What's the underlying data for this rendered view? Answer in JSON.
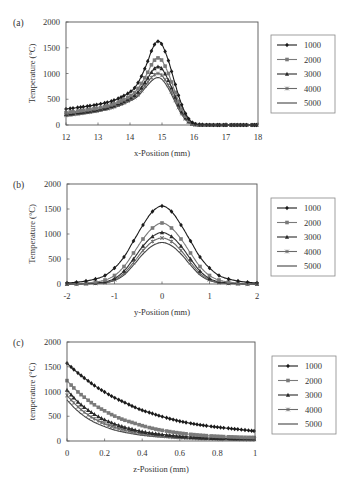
{
  "figure": {
    "panels": [
      {
        "id": "a",
        "label": "(a)"
      },
      {
        "id": "b",
        "label": "(b)"
      },
      {
        "id": "c",
        "label": "(c)"
      }
    ]
  },
  "chart_data": [
    {
      "type": "line",
      "panel_label": "(a)",
      "title": "",
      "xlabel": "x-Position (mm)",
      "ylabel": "Temperature (°C)",
      "xlim": [
        12,
        18
      ],
      "ylim": [
        0,
        2000
      ],
      "xticks": [
        "12",
        "13",
        "14",
        "15",
        "16",
        "17",
        "18"
      ],
      "yticks": [
        "0",
        "500",
        "1000",
        "1500",
        "2000"
      ],
      "grid": false,
      "legend_position": "right",
      "data_note": "Series values are approximate: peak/endpoint anchors read visually from the figure, intermediate points generated from a fitted skewed-peak curve. Not digitized per-point.",
      "x": [
        12.0,
        12.5,
        13.0,
        13.5,
        14.0,
        14.25,
        14.5,
        14.7,
        14.85,
        15.0,
        15.2,
        15.4,
        15.6,
        15.8,
        16.0,
        16.3,
        17.0,
        18.0
      ],
      "series": [
        {
          "name": "1000",
          "marker": "diamond",
          "color": "#1a1a1a",
          "values": [
            310,
            350,
            400,
            480,
            640,
            820,
            1150,
            1480,
            1620,
            1560,
            1250,
            820,
            420,
            150,
            30,
            5,
            0,
            0
          ]
        },
        {
          "name": "2000",
          "marker": "square",
          "color": "#7a7a7a",
          "values": [
            240,
            280,
            330,
            410,
            560,
            710,
            960,
            1200,
            1300,
            1250,
            1000,
            660,
            330,
            110,
            20,
            3,
            0,
            0
          ]
        },
        {
          "name": "3000",
          "marker": "triangle",
          "color": "#2a2a2a",
          "values": [
            210,
            250,
            300,
            380,
            520,
            640,
            860,
            1050,
            1130,
            1090,
            870,
            570,
            280,
            90,
            15,
            2,
            0,
            0
          ]
        },
        {
          "name": "4000",
          "marker": "cross",
          "color": "#6a6a6a",
          "values": [
            190,
            230,
            280,
            355,
            490,
            590,
            790,
            940,
            1000,
            960,
            770,
            500,
            240,
            75,
            12,
            2,
            0,
            0
          ]
        },
        {
          "name": "5000",
          "marker": "none",
          "color": "#444444",
          "values": [
            170,
            210,
            260,
            335,
            465,
            560,
            740,
            870,
            920,
            885,
            710,
            460,
            220,
            65,
            10,
            1,
            0,
            0
          ]
        }
      ]
    },
    {
      "type": "line",
      "panel_label": "(b)",
      "title": "",
      "xlabel": "y-Position (mm)",
      "ylabel": "Temperature (°C)",
      "xlim": [
        -2,
        2
      ],
      "ylim": [
        0,
        2000
      ],
      "xticks": [
        "-2",
        "-1",
        "0",
        "1",
        "2"
      ],
      "yticks": [
        "0",
        "500",
        "1000",
        "1500",
        "2000"
      ],
      "grid": false,
      "legend_position": "right",
      "data_note": "Series values are approximate: peak anchors read visually from the figure, intermediate points generated from a fitted Gaussian curve. Not digitized per-point.",
      "x": [
        -2.0,
        -1.8,
        -1.6,
        -1.4,
        -1.2,
        -1.0,
        -0.8,
        -0.6,
        -0.4,
        -0.2,
        0.0,
        0.2,
        0.4,
        0.6,
        0.8,
        1.0,
        1.2,
        1.4,
        1.6,
        1.8,
        2.0
      ],
      "series": [
        {
          "name": "1000",
          "marker": "diamond",
          "color": "#1a1a1a",
          "values": [
            20,
            35,
            60,
            100,
            170,
            320,
            540,
            860,
            1180,
            1450,
            1560,
            1450,
            1180,
            860,
            540,
            320,
            170,
            100,
            60,
            35,
            20
          ]
        },
        {
          "name": "2000",
          "marker": "square",
          "color": "#7a7a7a",
          "values": [
            5,
            10,
            20,
            40,
            80,
            170,
            350,
            620,
            900,
            1120,
            1220,
            1120,
            900,
            620,
            350,
            170,
            80,
            40,
            20,
            10,
            5
          ]
        },
        {
          "name": "3000",
          "marker": "triangle",
          "color": "#2a2a2a",
          "values": [
            2,
            5,
            10,
            20,
            45,
            110,
            260,
            500,
            760,
            950,
            1030,
            950,
            760,
            500,
            260,
            110,
            45,
            20,
            10,
            5,
            2
          ]
        },
        {
          "name": "4000",
          "marker": "cross",
          "color": "#6a6a6a",
          "values": [
            1,
            3,
            6,
            14,
            32,
            85,
            215,
            430,
            670,
            850,
            920,
            850,
            670,
            430,
            215,
            85,
            32,
            14,
            6,
            3,
            1
          ]
        },
        {
          "name": "5000",
          "marker": "none",
          "color": "#444444",
          "values": [
            0,
            2,
            4,
            10,
            25,
            70,
            180,
            380,
            600,
            765,
            830,
            765,
            600,
            380,
            180,
            70,
            25,
            10,
            4,
            2,
            0
          ]
        }
      ]
    },
    {
      "type": "line",
      "panel_label": "(c)",
      "title": "",
      "xlabel": "z-Position (mm)",
      "ylabel": "temperature (°C)",
      "xlim": [
        0,
        1
      ],
      "ylim": [
        0,
        2000
      ],
      "xticks": [
        "0",
        "0.2",
        "0.4",
        "0.6",
        "0.8",
        "1"
      ],
      "yticks": [
        "0",
        "500",
        "1000",
        "1500",
        "2000"
      ],
      "grid": false,
      "legend_position": "right",
      "data_note": "Series values are approximate: starting/endpoint anchors read visually from the figure, intermediate points generated from a fitted exponential-decay curve. Not digitized per-point.",
      "x": [
        0.0,
        0.05,
        0.1,
        0.15,
        0.2,
        0.25,
        0.3,
        0.35,
        0.4,
        0.45,
        0.5,
        0.6,
        0.7,
        0.8,
        0.9,
        1.0
      ],
      "series": [
        {
          "name": "1000",
          "marker": "diamond",
          "color": "#1a1a1a",
          "values": [
            1570,
            1400,
            1250,
            1110,
            990,
            880,
            790,
            700,
            620,
            560,
            500,
            400,
            330,
            280,
            240,
            200
          ]
        },
        {
          "name": "2000",
          "marker": "square",
          "color": "#7a7a7a",
          "values": [
            1220,
            1020,
            860,
            720,
            610,
            510,
            430,
            370,
            310,
            260,
            220,
            160,
            120,
            95,
            80,
            70
          ]
        },
        {
          "name": "3000",
          "marker": "triangle",
          "color": "#2a2a2a",
          "values": [
            1030,
            820,
            660,
            530,
            430,
            350,
            285,
            235,
            190,
            160,
            135,
            95,
            70,
            55,
            48,
            45
          ]
        },
        {
          "name": "4000",
          "marker": "cross",
          "color": "#6a6a6a",
          "values": [
            920,
            720,
            560,
            440,
            350,
            280,
            225,
            180,
            145,
            120,
            100,
            70,
            52,
            42,
            37,
            35
          ]
        },
        {
          "name": "5000",
          "marker": "none",
          "color": "#444444",
          "values": [
            830,
            630,
            480,
            370,
            290,
            225,
            180,
            145,
            115,
            95,
            80,
            55,
            40,
            32,
            28,
            25
          ]
        }
      ]
    }
  ]
}
